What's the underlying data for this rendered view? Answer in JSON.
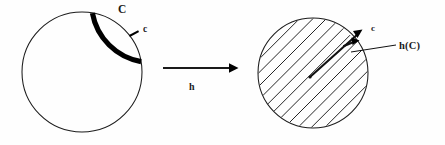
{
  "figure": {
    "background_color": "#fefefe",
    "ink_color": "#1a1a1a",
    "left_shape": {
      "name": "circle-outline",
      "center_x": 82,
      "center_y": 72,
      "radius": 60,
      "arc_start_deg": 10,
      "arc_end_deg": 80,
      "arc_color": "#000000",
      "labels": {
        "curve_label": "C",
        "point_label": "c"
      }
    },
    "map_arrow": {
      "name": "mapping-arrow",
      "label": "h",
      "x_start": 163,
      "x_end": 237,
      "y": 68
    },
    "right_shape": {
      "name": "hatched-disk",
      "center_x": 313,
      "center_y": 73,
      "radius": 55,
      "hatch_angle_deg": 45,
      "hatch_spacing": 9.5,
      "labels": {
        "point_label": "c",
        "image_label": "h(C)"
      }
    }
  }
}
